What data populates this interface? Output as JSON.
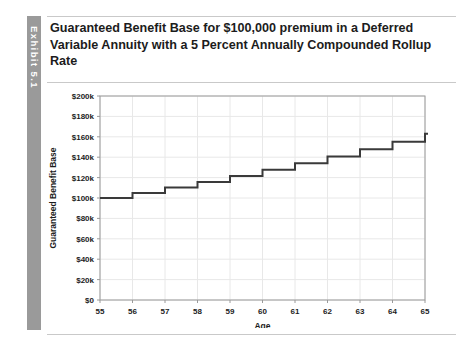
{
  "exhibit": {
    "tab_label": "Exhibit 5.1"
  },
  "title": "Guaranteed Benefit Base for $100,000 premium in a Deferred Variable Annuity with a 5 Percent Annually Compounded Rollup Rate",
  "chart_data": {
    "type": "line",
    "line_style": "step",
    "title": "Guaranteed Benefit Base for $100,000 premium in a Deferred Variable Annuity with a 5 Percent Annually Compounded Rollup Rate",
    "xlabel": "Age",
    "ylabel": "Guaranteed Benefit Base",
    "x": [
      55,
      56,
      57,
      58,
      59,
      60,
      61,
      62,
      63,
      64,
      65
    ],
    "values": [
      100000,
      105000,
      110250,
      115763,
      121551,
      127628,
      134010,
      140710,
      147746,
      155133,
      162889
    ],
    "xlim": [
      55,
      65
    ],
    "ylim": [
      0,
      200000
    ],
    "xticks": [
      55,
      56,
      57,
      58,
      59,
      60,
      61,
      62,
      63,
      64,
      65
    ],
    "xtick_labels": [
      "55",
      "56",
      "57",
      "58",
      "59",
      "60",
      "61",
      "62",
      "63",
      "64",
      "65"
    ],
    "yticks": [
      0,
      20000,
      40000,
      60000,
      80000,
      100000,
      120000,
      140000,
      160000,
      180000,
      200000
    ],
    "ytick_labels": [
      "$0",
      "$20k",
      "$40k",
      "$60k",
      "$80k",
      "$100k",
      "$120k",
      "$140k",
      "$160k",
      "$180k",
      "$200k"
    ],
    "grid": true,
    "legend": null,
    "series_color": "#3a3a3a",
    "grid_color": "#e8e8e8",
    "axis_color": "#9a9a9a"
  }
}
